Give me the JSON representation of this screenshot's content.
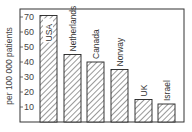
{
  "chart_data": {
    "type": "bar",
    "title": "",
    "xlabel": "",
    "ylabel": "per 100 000 patients",
    "categories": [
      "USA",
      "Netherlands",
      "Canada",
      "Norway",
      "UK",
      "Israel"
    ],
    "values": [
      71,
      45,
      40,
      35,
      15,
      12
    ],
    "ylim": [
      0,
      75
    ],
    "yticks": [
      10,
      20,
      30,
      40,
      50,
      60,
      70
    ],
    "grid": false,
    "legend": null,
    "bar_fill": "diagonal-hatch",
    "bar_stroke": "#222222",
    "labels_inside_bars": "rotated vertical text above/at top of each bar"
  }
}
